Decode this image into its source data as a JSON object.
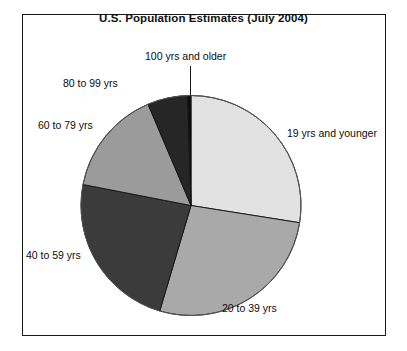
{
  "chart": {
    "title": "U.S. Population Estimates (July 2004)",
    "frame_color": "#1a1a1a",
    "background": "#ffffff"
  },
  "chart_data": {
    "type": "pie",
    "title": "U.S. Population Estimates (July 2004)",
    "xlabel": "",
    "ylabel": "",
    "legend": "none (direct labels with leader lines)",
    "start_angle_deg": 0,
    "direction": "clockwise",
    "labels": [
      "19 yrs and younger",
      "20 to 39 yrs",
      "40 to 59 yrs",
      "60 to 79 yrs",
      "80 to 99 yrs",
      "100 yrs and older"
    ],
    "values": [
      27.5,
      27.0,
      23.5,
      15.5,
      6.0,
      0.5
    ],
    "colors": [
      "#e2e2e2",
      "#a9a9a9",
      "#3b3b3b",
      "#9b9b9b",
      "#262626",
      "#0d0d0d"
    ],
    "slices": [
      {
        "label": "19 yrs and younger",
        "value": 27.5,
        "start_deg": 0.0,
        "end_deg": 99.0,
        "color": "#e2e2e2"
      },
      {
        "label": "20 to 39 yrs",
        "value": 27.0,
        "start_deg": 99.0,
        "end_deg": 196.5,
        "color": "#a9a9a9"
      },
      {
        "label": "40 to 59 yrs",
        "value": 23.5,
        "start_deg": 196.5,
        "end_deg": 281.0,
        "color": "#3b3b3b"
      },
      {
        "label": "60 to 79 yrs",
        "value": 15.5,
        "start_deg": 281.0,
        "end_deg": 337.0,
        "color": "#9b9b9b"
      },
      {
        "label": "80 to 99 yrs",
        "value": 6.0,
        "start_deg": 337.0,
        "end_deg": 358.3,
        "color": "#262626"
      },
      {
        "label": "100 yrs and older",
        "value": 0.5,
        "start_deg": 358.3,
        "end_deg": 360.0,
        "color": "#0d0d0d"
      }
    ]
  },
  "labels": {
    "top_center": "100 yrs and older",
    "upper_left": "80 to 99 yrs",
    "left": "60 to 79 yrs",
    "lower_left": "40 to 59 yrs",
    "bottom_right": "20 to 39 yrs",
    "right": "19 yrs and younger"
  }
}
